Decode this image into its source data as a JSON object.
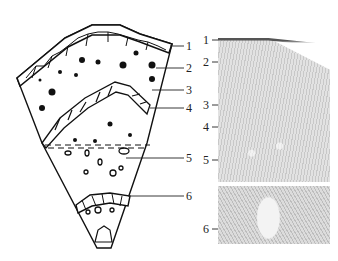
{
  "figure": {
    "type": "plant stem cross-section diagram with micrograph",
    "left_panel": {
      "description": "schematic wedge of stem cross-section",
      "labels": [
        "1",
        "2",
        "3",
        "4",
        "5",
        "6"
      ]
    },
    "right_panel": {
      "description": "light micrograph of stem cross-section, split into two parts",
      "labels_top": [
        "1",
        "2",
        "3",
        "4",
        "5"
      ],
      "labels_bottom": [
        "6"
      ]
    }
  }
}
